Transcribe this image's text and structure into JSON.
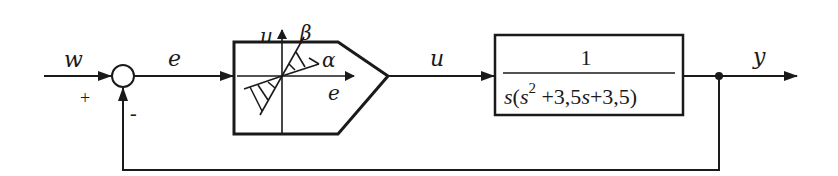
{
  "diagram": {
    "type": "closed-loop block diagram",
    "colors": {
      "line": "#1a1a1a",
      "background": "#ffffff"
    },
    "signals": {
      "input": "w",
      "error": "e",
      "control": "u",
      "output": "y"
    },
    "summing_junction": {
      "plus_sign": "+",
      "minus_sign": "-"
    },
    "nonlinear_block": {
      "axis_vertical_label": "u",
      "axis_horizontal_label": "e",
      "angle_upper_label": "β",
      "angle_lower_label": "α"
    },
    "transfer_function_block": {
      "numerator": "1",
      "denominator_parts": {
        "s_outer": "s",
        "open_paren": "(",
        "s_inner": "s",
        "exponent": "2",
        "term1": " +3,5",
        "s_term": "s",
        "term2": "+3,5)"
      },
      "denominator_full": "s(s^2 +3,5s+3,5)"
    }
  }
}
